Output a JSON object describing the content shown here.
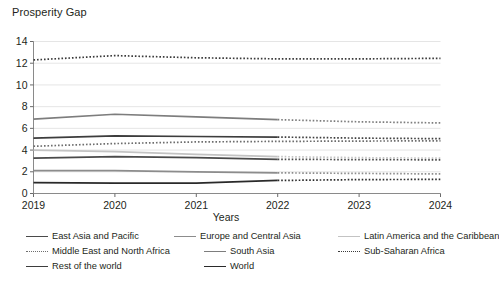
{
  "chart_data": {
    "type": "line",
    "title": "",
    "ylabel": "Prosperity Gap",
    "xlabel": "Years",
    "x": [
      2019,
      2020,
      2021,
      2022,
      2023,
      2024
    ],
    "xtick_labels": [
      "2019",
      "2020",
      "2021",
      "2022",
      "2023",
      "2024"
    ],
    "ytick_labels": [
      "0",
      "2",
      "4",
      "6",
      "8",
      "10",
      "12",
      "14"
    ],
    "yticks": [
      0,
      2,
      4,
      6,
      8,
      10,
      12,
      14
    ],
    "ylim": [
      0,
      14
    ],
    "xlim": [
      2019,
      2024
    ],
    "grid": "horizontal",
    "legend_position": "bottom",
    "projection_starts": 2022,
    "series": [
      {
        "name": "East Asia and Pacific",
        "color": "#4a4a4a",
        "style": "solid",
        "values": [
          3.25,
          3.4,
          3.3,
          3.15,
          3.12,
          3.1
        ]
      },
      {
        "name": "Europe and Central Asia",
        "color": "#8c8c8c",
        "style": "solid",
        "values": [
          2.1,
          2.1,
          2.0,
          1.9,
          1.85,
          1.8
        ]
      },
      {
        "name": "Latin America and the Caribbean",
        "color": "#c3c3c3",
        "style": "solid",
        "values": [
          4.0,
          3.85,
          3.6,
          3.4,
          3.3,
          3.25
        ]
      },
      {
        "name": "Middle East and North Africa",
        "color": "#6e6e6e",
        "style": "dotted",
        "values": [
          4.35,
          4.6,
          4.75,
          4.8,
          4.83,
          4.85
        ]
      },
      {
        "name": "South Asia",
        "color": "#7d7d7d",
        "style": "solid",
        "values": [
          6.85,
          7.3,
          7.05,
          6.8,
          6.6,
          6.5
        ]
      },
      {
        "name": "Sub-Saharan Africa",
        "color": "#3a3a3a",
        "style": "dotted",
        "values": [
          12.3,
          12.7,
          12.5,
          12.4,
          12.4,
          12.45
        ]
      },
      {
        "name": "Rest of the world",
        "color": "#3d3d3d",
        "style": "solid",
        "values": [
          5.1,
          5.3,
          5.25,
          5.2,
          5.1,
          5.05
        ]
      },
      {
        "name": "World",
        "color": "#2a2a2a",
        "style": "solid",
        "values": [
          1.0,
          0.95,
          0.95,
          1.2,
          1.28,
          1.3
        ]
      }
    ]
  },
  "legend": {
    "rows": [
      [
        {
          "label": "East Asia and Pacific",
          "color": "#4a4a4a",
          "style": "solid",
          "left": 0
        },
        {
          "label": "Europe and Central Asia",
          "color": "#8c8c8c",
          "style": "solid",
          "left": 148
        },
        {
          "label": "Latin America and the Caribbean",
          "color": "#c3c3c3",
          "style": "solid",
          "left": 312
        }
      ],
      [
        {
          "label": "Middle East and North Africa",
          "color": "#6e6e6e",
          "style": "dotted",
          "left": 0
        },
        {
          "label": "South Asia",
          "color": "#7d7d7d",
          "style": "solid",
          "left": 178
        },
        {
          "label": "Sub-Saharan Africa",
          "color": "#3a3a3a",
          "style": "dotted",
          "left": 312
        }
      ],
      [
        {
          "label": "Rest of the world",
          "color": "#3d3d3d",
          "style": "solid",
          "left": 0
        },
        {
          "label": "World",
          "color": "#2a2a2a",
          "style": "solid",
          "left": 178
        }
      ]
    ]
  }
}
